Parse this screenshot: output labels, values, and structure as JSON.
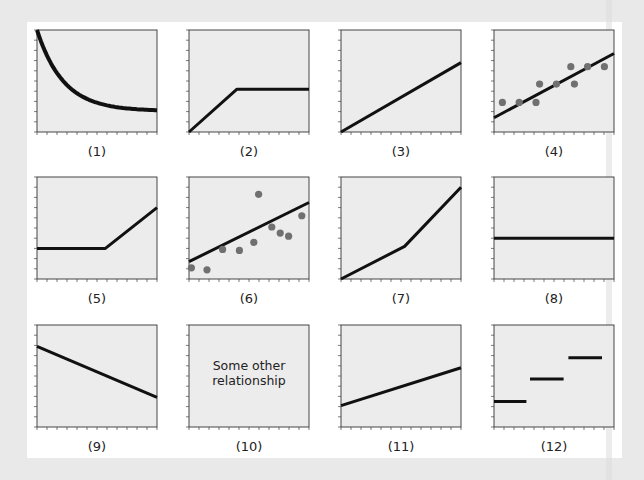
{
  "figure": {
    "background_color": "#e9e9e9",
    "panel_color": "#ffffff",
    "plot_fill": "#ececec",
    "line_color": "#111111",
    "dot_color": "#707070"
  },
  "plots": [
    {
      "label": "(1)",
      "kind": "decaying-curve"
    },
    {
      "label": "(2)",
      "kind": "rise-then-plateau"
    },
    {
      "label": "(3)",
      "kind": "linear-increase"
    },
    {
      "label": "(4)",
      "kind": "scatter-positive-fit"
    },
    {
      "label": "(5)",
      "kind": "flat-then-rise"
    },
    {
      "label": "(6)",
      "kind": "scatter-weak-fit-outlier"
    },
    {
      "label": "(7)",
      "kind": "piecewise-accelerating"
    },
    {
      "label": "(8)",
      "kind": "constant"
    },
    {
      "label": "(9)",
      "kind": "linear-decrease"
    },
    {
      "label": "(10)",
      "kind": "other",
      "text_line1": "Some other",
      "text_line2": "relationship"
    },
    {
      "label": "(11)",
      "kind": "shallow-linear-increase"
    },
    {
      "label": "(12)",
      "kind": "step-function"
    }
  ],
  "chart_data": [
    {
      "type": "line",
      "title": "(1)",
      "x": [
        0,
        1,
        2,
        3,
        4,
        5,
        6,
        7,
        8,
        9,
        10
      ],
      "values": [
        10,
        7.2,
        5.4,
        4.2,
        3.4,
        2.8,
        2.4,
        2.2,
        2.1,
        2.05,
        2.05
      ],
      "ylim": [
        0,
        10
      ],
      "grid": false
    },
    {
      "type": "line",
      "title": "(2)",
      "x": [
        0,
        4,
        10
      ],
      "values": [
        0,
        4.2,
        4.2
      ],
      "ylim": [
        0,
        10
      ]
    },
    {
      "type": "line",
      "title": "(3)",
      "x": [
        0,
        10
      ],
      "values": [
        0,
        6.8
      ],
      "ylim": [
        0,
        10
      ]
    },
    {
      "type": "scatter",
      "title": "(4)",
      "points": [
        [
          0.7,
          2.9
        ],
        [
          2.1,
          2.9
        ],
        [
          3.5,
          2.9
        ],
        [
          3.8,
          4.7
        ],
        [
          5.2,
          4.7
        ],
        [
          6.4,
          6.4
        ],
        [
          6.7,
          4.7
        ],
        [
          7.8,
          6.4
        ],
        [
          9.2,
          6.4
        ]
      ],
      "fit_line": {
        "x": [
          0,
          10
        ],
        "values": [
          1.4,
          7.7
        ]
      },
      "ylim": [
        0,
        10
      ]
    },
    {
      "type": "line",
      "title": "(5)",
      "x": [
        0,
        5.7,
        10
      ],
      "values": [
        3,
        3,
        7
      ],
      "ylim": [
        0,
        10
      ]
    },
    {
      "type": "scatter",
      "title": "(6)",
      "points": [
        [
          0.2,
          1.1
        ],
        [
          1.5,
          0.9
        ],
        [
          2.8,
          2.9
        ],
        [
          4.2,
          2.8
        ],
        [
          5.4,
          3.6
        ],
        [
          5.8,
          8.3
        ],
        [
          6.9,
          5.1
        ],
        [
          7.6,
          4.5
        ],
        [
          8.3,
          4.2
        ],
        [
          9.4,
          6.2
        ]
      ],
      "fit_line": {
        "x": [
          0,
          10
        ],
        "values": [
          1.7,
          7.5
        ]
      },
      "ylim": [
        0,
        10
      ]
    },
    {
      "type": "line",
      "title": "(7)",
      "x": [
        0,
        5.3,
        10
      ],
      "values": [
        0,
        3.2,
        9
      ],
      "ylim": [
        0,
        10
      ]
    },
    {
      "type": "line",
      "title": "(8)",
      "x": [
        0,
        10
      ],
      "values": [
        4,
        4
      ],
      "ylim": [
        0,
        10
      ]
    },
    {
      "type": "line",
      "title": "(9)",
      "x": [
        0,
        10
      ],
      "values": [
        7.9,
        2.9
      ],
      "ylim": [
        0,
        10
      ]
    },
    {
      "type": "table",
      "title": "(10)",
      "annotation": "Some other relationship"
    },
    {
      "type": "line",
      "title": "(11)",
      "x": [
        0,
        10
      ],
      "values": [
        2.1,
        5.8
      ],
      "ylim": [
        0,
        10
      ]
    },
    {
      "type": "line",
      "title": "(12) step",
      "segments": [
        {
          "x": [
            0,
            2.7
          ],
          "y": 2.5
        },
        {
          "x": [
            3,
            5.8
          ],
          "y": 4.7
        },
        {
          "x": [
            6.2,
            9
          ],
          "y": 6.8
        }
      ],
      "ylim": [
        0,
        10
      ]
    }
  ]
}
